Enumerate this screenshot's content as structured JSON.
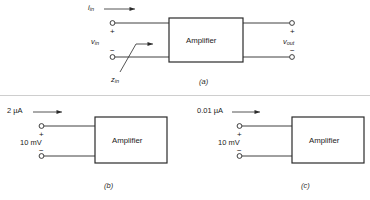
{
  "figure": {
    "title_caption_a": "(a)",
    "title_caption_b": "(b)",
    "title_caption_c": "(c)",
    "block_label": "Amplifier",
    "panel_a": {
      "current_label_base": "i",
      "current_label_sub": "in",
      "voltage_in_base": "v",
      "voltage_in_sub": "in",
      "voltage_out_base": "v",
      "voltage_out_sub": "out",
      "impedance_base": "z",
      "impedance_sub": "in",
      "plus_sign": "+",
      "minus_sign": "−",
      "plus_sign_out": "+",
      "minus_sign_out": "−",
      "block_label": "Amplifier"
    },
    "panel_b": {
      "current_label": "2 µA",
      "voltage_label": "10 mV",
      "plus_sign": "+",
      "minus_sign": "−",
      "block_label": "Amplifier"
    },
    "panel_c": {
      "current_label": "0.01 µA",
      "voltage_label": "10 mV",
      "plus_sign": "+",
      "minus_sign": "−",
      "block_label": "Amplifier"
    },
    "colors": {
      "background": "#ffffff",
      "line": "#2a2a2a",
      "box_border": "#2a2a2a",
      "text": "#1b1b1b",
      "divider": "#9a9a9a"
    }
  }
}
